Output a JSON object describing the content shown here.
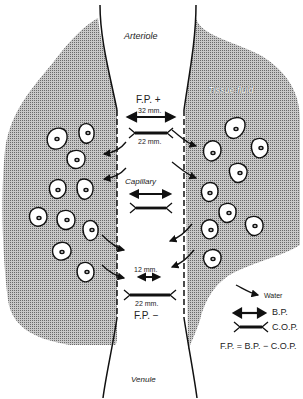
{
  "diagram": {
    "labels": {
      "arteriole": "Arteriole",
      "tissue_fluid": "Tissue fluid",
      "capillary": "Capillary",
      "venule": "Venule",
      "fp_plus": "F.P. +",
      "fp_minus": "F.P. −",
      "bp_arterial": "32 mm.",
      "cop_arterial": "22 mm.",
      "bp_venous": "12 mm.",
      "cop_venous": "22 mm."
    },
    "legend": {
      "water": "Water",
      "bp": "B.P.",
      "cop": "C.O.P.",
      "equation": "F.P. = B.P. − C.O.P."
    },
    "colors": {
      "tissue_fill": "#9a9a9a",
      "line": "#111111",
      "background": "#ffffff"
    }
  }
}
